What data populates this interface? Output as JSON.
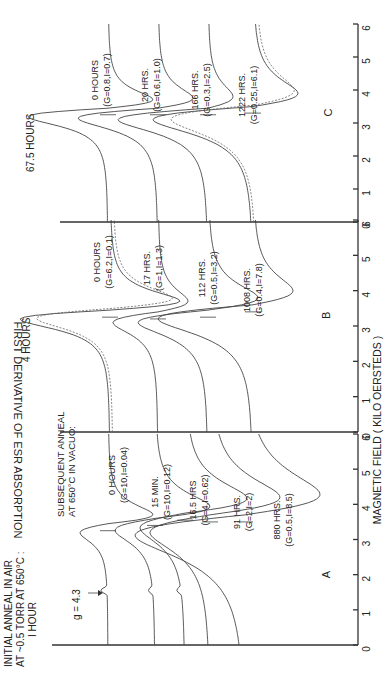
{
  "figure": {
    "orientation": "rotated 90 degrees counter-clockwise",
    "y_axis_label": "FIRST DERIVATIVE OF ESR ABSORPTION",
    "x_axis_label": "MAGNETIC FIELD ( KILO OERSTEDS )",
    "initial_anneal_note": [
      "INITIAL ANNEAL IN AIR",
      "AT ~0.5 TORR AT 650°C :",
      "I HOUR"
    ],
    "subsequent_anneal_note": [
      "SUBSEQUENT ANNEAL",
      "AT 650°C IN VACUO:"
    ],
    "g_marker_label": "g = 4.3",
    "panels": [
      {
        "id": "A",
        "letter": "A",
        "title": "",
        "ticks": [
          "0",
          "1",
          "2",
          "3",
          "4",
          "5",
          "6"
        ]
      },
      {
        "id": "B",
        "letter": "B",
        "title": "4 HOURS",
        "ticks": [
          "0",
          "1",
          "2",
          "3",
          "4",
          "5",
          "6"
        ]
      },
      {
        "id": "C",
        "letter": "C",
        "title": "67.5 HOURS",
        "ticks": [
          "0",
          "1",
          "2",
          "3",
          "4",
          "5",
          "6"
        ]
      }
    ]
  },
  "chart_data": [
    {
      "type": "line",
      "panel": "A",
      "title": "Initial anneal in air at ~0.5 torr at 650°C: 1 hour; subsequent anneal at 650°C in vacuo",
      "xlabel": "MAGNETIC FIELD ( KILO OERSTEDS )",
      "ylabel": "FIRST DERIVATIVE OF ESR ABSORPTION",
      "xlim": [
        0,
        6
      ],
      "annotation": "g = 4.3 (arrow at ~1.55 kOe)",
      "series": [
        {
          "name": "0 HOURS",
          "label_line1": "0 HOURS",
          "label_line2": "(G=10,I=0.04)"
        },
        {
          "name": "15 MIN.",
          "label_line1": "15 MIN.",
          "label_line2": "(G=10,I=0.12)"
        },
        {
          "name": "16.5 HRS",
          "label_line1": "16.5 HRS",
          "label_line2": "(G=4,I=0.62)"
        },
        {
          "name": "91 HRS.",
          "label_line1": "91 HRS.",
          "label_line2": "(G=2,I=2)"
        },
        {
          "name": "880 HRS.",
          "label_line1": "880 HRS.",
          "label_line2": "(G=0.5,I=8.5)"
        }
      ]
    },
    {
      "type": "line",
      "panel": "B",
      "title": "4 HOURS",
      "xlabel": "MAGNETIC FIELD ( KILO OERSTEDS )",
      "ylabel": "FIRST DERIVATIVE OF ESR ABSORPTION",
      "xlim": [
        0,
        6
      ],
      "series": [
        {
          "name": "0 HOURS",
          "label_line1": "0 HOURS",
          "label_line2": "(G=6.2,I=0.1)"
        },
        {
          "name": "17 HRS.",
          "label_line1": "17 HRS.",
          "label_line2": "(G=1,I=1.3)"
        },
        {
          "name": "112 HRS.",
          "label_line1": "112 HRS.",
          "label_line2": "(G=0.5,I=3.2)"
        },
        {
          "name": "1008 HRS.",
          "label_line1": "1008 HRS.",
          "label_line2": "(G=0.4,I=7.8)"
        }
      ]
    },
    {
      "type": "line",
      "panel": "C",
      "title": "67.5 HOURS",
      "xlabel": "MAGNETIC FIELD ( KILO OERSTEDS )",
      "ylabel": "FIRST DERIVATIVE OF ESR ABSORPTION",
      "xlim": [
        0,
        6
      ],
      "series": [
        {
          "name": "0 HOURS",
          "label_line1": "0 HOURS",
          "label_line2": "(G=0.8,I=0.7)"
        },
        {
          "name": "20 HRS.",
          "label_line1": "20 HRS.",
          "label_line2": "(G=0.6,I=1.0)"
        },
        {
          "name": "166 HRS.",
          "label_line1": "166 HRS.",
          "label_line2": "(G=0.3,I=2.5)"
        },
        {
          "name": "1222 HRS.",
          "label_line1": "1222 HRS.",
          "label_line2": "(G=0.25,I=6.1)"
        }
      ]
    }
  ]
}
